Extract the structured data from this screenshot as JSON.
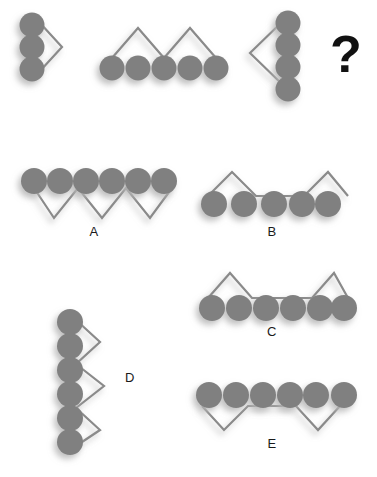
{
  "puzzle": {
    "type": "visual-analogy-matrix",
    "background_color": "#ffffff",
    "circle_color": "#808080",
    "line_color": "#8a8a8a",
    "shadow_color": "#b5b5b5",
    "label_color": "#1a1a1a",
    "question_mark": "?",
    "prompt_row": {
      "name": "prompt-sequence",
      "items": [
        {
          "id": "prompt-1",
          "circle_count": 3,
          "circle_layout": "vertical",
          "line_shape": "greater-than-chevron-right",
          "line_side": "right",
          "line_vertices": 3
        },
        {
          "id": "prompt-2",
          "circle_count": 5,
          "circle_layout": "horizontal",
          "line_shape": "double-peak-zigzag-M",
          "line_side": "above",
          "line_vertices": 5
        },
        {
          "id": "prompt-3",
          "circle_count": 4,
          "circle_layout": "vertical",
          "line_shape": "less-than-chevron-left",
          "line_side": "left",
          "line_vertices": 3
        },
        {
          "id": "prompt-4",
          "circle_count": 0,
          "circle_layout": "none",
          "line_shape": "unknown",
          "line_side": "none",
          "line_vertices": 0
        }
      ]
    },
    "options": [
      {
        "id": "option-a",
        "label": "A",
        "circle_count": 6,
        "circle_layout": "horizontal",
        "line_shape": "triple-valley-zigzag-W",
        "line_side": "below",
        "line_vertices": 7
      },
      {
        "id": "option-b",
        "label": "B",
        "circle_count": 5,
        "circle_layout": "horizontal",
        "line_shape": "two-peaks-flat-middle",
        "line_side": "above",
        "line_vertices": 6
      },
      {
        "id": "option-c",
        "label": "C",
        "circle_count": 6,
        "circle_layout": "horizontal",
        "line_shape": "two-peaks-flat-middle",
        "line_side": "above",
        "line_vertices": 6
      },
      {
        "id": "option-d",
        "label": "D",
        "circle_count": 6,
        "circle_layout": "vertical",
        "line_shape": "triple-point-zigzag-right",
        "line_side": "right",
        "line_vertices": 7
      },
      {
        "id": "option-e",
        "label": "E",
        "circle_count": 6,
        "circle_layout": "horizontal",
        "line_shape": "two-valleys-flat-middle",
        "line_side": "below",
        "line_vertices": 6
      }
    ]
  }
}
